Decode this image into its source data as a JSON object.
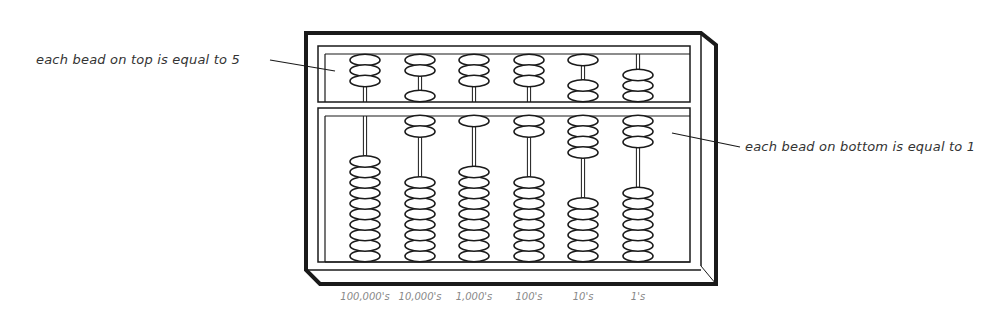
{
  "annotations": {
    "top": "each bead on top is equal to 5",
    "bottom": "each bead on bottom is equal to 1"
  },
  "columns": [
    {
      "label": "100,000's",
      "x": 365,
      "upper_top": 3,
      "upper_bottom": 0,
      "lower_top": 0,
      "lower_bottom": 10
    },
    {
      "label": "10,000's",
      "x": 420,
      "upper_top": 2,
      "upper_bottom": 1,
      "lower_top": 2,
      "lower_bottom": 8
    },
    {
      "label": "1,000's",
      "x": 474,
      "upper_top": 3,
      "upper_bottom": 0,
      "lower_top": 1,
      "lower_bottom": 9
    },
    {
      "label": "100's",
      "x": 529,
      "upper_top": 3,
      "upper_bottom": 0,
      "lower_top": 2,
      "lower_bottom": 8
    },
    {
      "label": "10's",
      "x": 583,
      "upper_top": 1,
      "upper_bottom": 2,
      "lower_top": 4,
      "lower_bottom": 6
    },
    {
      "label": "1's",
      "x": 638,
      "upper_top": 0,
      "upper_bottom": 3,
      "lower_top": 3,
      "lower_bottom": 7
    }
  ],
  "colors": {
    "ink": "#1a1a1a",
    "label": "#888888",
    "text": "#333333"
  }
}
